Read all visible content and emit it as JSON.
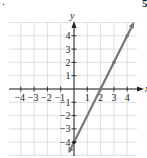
{
  "fragments": {
    "top_left": ".",
    "top_right": "5"
  },
  "chart_data": {
    "type": "line",
    "title": "",
    "xlabel": "x",
    "ylabel": "y",
    "xlim": [
      -4.8,
      4.8
    ],
    "ylim": [
      -5,
      5
    ],
    "grid": true,
    "x_ticks": [
      -4,
      -3,
      -2,
      -1,
      1,
      2,
      3,
      4
    ],
    "y_ticks": [
      -4,
      -3,
      -2,
      -1,
      1,
      2,
      3,
      4
    ],
    "x_tick_labels": [
      "−4",
      "−3",
      "−2",
      "−1",
      "1",
      "2",
      "3",
      "4"
    ],
    "y_tick_labels": [
      "−4",
      "−3",
      "−2",
      "−1",
      "1",
      "2",
      "3",
      "4"
    ],
    "series": [
      {
        "name": "y = 2x − 4",
        "equation": "y = 2x - 4",
        "slope": 2,
        "intercept": -4,
        "x": [
          0,
          2,
          3,
          4
        ],
        "y": [
          -4,
          0,
          2,
          4
        ],
        "marked_points": [
          [
            0,
            -4
          ],
          [
            2,
            0
          ],
          [
            3,
            2
          ],
          [
            4,
            4
          ]
        ],
        "color": "#777777"
      }
    ],
    "colors": {
      "grid": "#d8d8d8",
      "axis": "#222222",
      "line": "#777777",
      "text": "#222222"
    }
  }
}
